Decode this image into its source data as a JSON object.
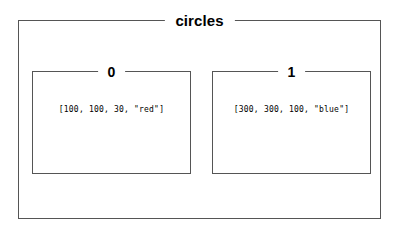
{
  "container": {
    "legend": "circles"
  },
  "items": [
    {
      "legend": "0",
      "value": "[100, 100, 30, \"red\"]"
    },
    {
      "legend": "1",
      "value": "[300, 300, 100, \"blue\"]"
    }
  ],
  "colors": {
    "border": "#555555",
    "text": "#000000",
    "background": "#ffffff"
  }
}
